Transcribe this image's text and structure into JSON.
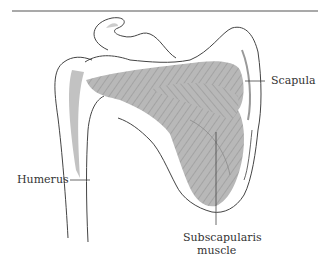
{
  "diagram": {
    "title": "",
    "labels": {
      "scapula": "Scapula",
      "humerus": "Humerus",
      "subscapularis_line1": "Subscapularis",
      "subscapularis_line2": "muscle"
    },
    "colors": {
      "outline": "#444444",
      "muscle_fill": "#b5b5b5",
      "muscle_fiber": "#8a8a8a",
      "rule": "#555555"
    }
  }
}
